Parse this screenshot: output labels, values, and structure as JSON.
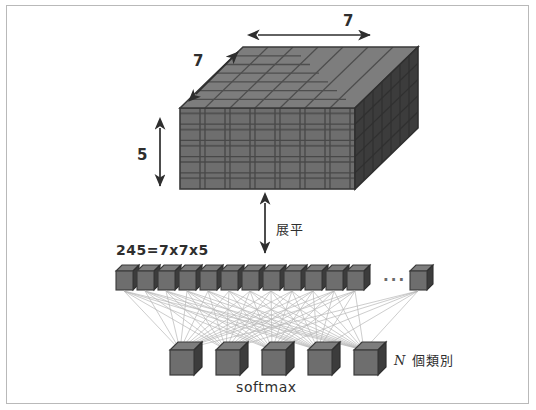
{
  "diagram": {
    "colors": {
      "cube_front": "#6e6e6e",
      "cube_top": "#7d7d7d",
      "cube_side": "#3c3c3c",
      "grid_line": "#4a4a4a",
      "connection_line": "#b5b5b5",
      "ink": "#2e2e2e",
      "frame": "#b9b9b9",
      "background": "#ffffff"
    },
    "volume": {
      "name": "feature-map-volume",
      "width_label": "7",
      "depth_label": "7",
      "height_label": "5",
      "grid_cols": 7,
      "grid_rows": 5,
      "grid_depth": 7
    },
    "flatten": {
      "label": "展平",
      "arrow": "double-vertical-arrow"
    },
    "flattened": {
      "count_label": "245=7x7x5",
      "total": 245,
      "visible_cubes": 12,
      "ellipsis": "...",
      "trailing_cubes": 1
    },
    "output": {
      "cubes": 5,
      "classes_label_prefix": "N",
      "classes_label_text": " 個類別",
      "softmax_label": "softmax"
    }
  }
}
